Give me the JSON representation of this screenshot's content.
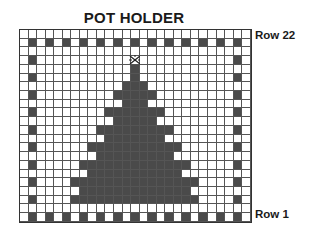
{
  "title": "POT HOLDER",
  "labels": {
    "top_row": "Row 22",
    "bottom_row": "Row 1"
  },
  "grid": {
    "cols": 27,
    "rows": 22,
    "cell_w": 8.56,
    "cell_h": 8.73,
    "colors": {
      "dark": "#4a4a4a",
      "light": "#ffffff",
      "line": "#555555"
    },
    "border_rows": [
      1,
      21
    ],
    "border_cols": [
      1,
      25
    ],
    "star": {
      "row": 3,
      "col": 13,
      "icon": "star-icon"
    },
    "tree_rows": [
      {
        "row": 4,
        "from": 13,
        "to": 13
      },
      {
        "row": 5,
        "from": 13,
        "to": 13
      },
      {
        "row": 6,
        "from": 12,
        "to": 14
      },
      {
        "row": 7,
        "from": 11,
        "to": 15
      },
      {
        "row": 8,
        "from": 12,
        "to": 14
      },
      {
        "row": 9,
        "from": 10,
        "to": 16
      },
      {
        "row": 10,
        "from": 11,
        "to": 15
      },
      {
        "row": 11,
        "from": 9,
        "to": 17
      },
      {
        "row": 12,
        "from": 10,
        "to": 16
      },
      {
        "row": 13,
        "from": 8,
        "to": 18
      },
      {
        "row": 14,
        "from": 9,
        "to": 17
      },
      {
        "row": 15,
        "from": 7,
        "to": 19
      },
      {
        "row": 16,
        "from": 8,
        "to": 18
      },
      {
        "row": 17,
        "from": 6,
        "to": 20
      },
      {
        "row": 18,
        "from": 7,
        "to": 19
      },
      {
        "row": 19,
        "from": 6,
        "to": 20
      }
    ]
  }
}
